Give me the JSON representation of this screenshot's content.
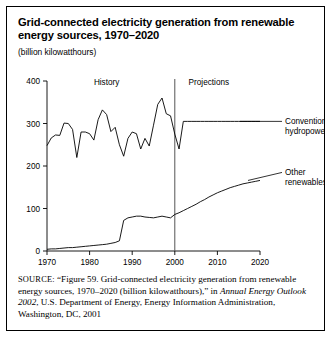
{
  "figure": {
    "title": "Grid-connected electricity generation from renewable energy sources, 1970–2020",
    "units": "(billion kilowatthours)",
    "source_kicker": "SOURCE:",
    "source_part1": " “Figure 59. Grid-connected electricity generation from renewable energy sources, 1970–2020 (billion kilowatthours),” in ",
    "source_italic": "Annual Energy Outlook 2002",
    "source_part2": ", U.S. Department of Energy, Energy Information Administration, Washington, DC, 2001"
  },
  "chart_data": {
    "type": "line",
    "title": "Grid-connected electricity generation from renewable energy sources, 1970–2020",
    "xlabel": "",
    "ylabel": "billion kilowatthours",
    "xlim": [
      1970,
      2020
    ],
    "ylim": [
      0,
      400
    ],
    "xticks": [
      1970,
      1980,
      1990,
      2000,
      2010,
      2020
    ],
    "yticks": [
      0,
      100,
      200,
      300,
      400
    ],
    "grid": false,
    "legend_position": "right-callout",
    "annotations": [
      {
        "text": "History",
        "x": 1984,
        "y": 390
      },
      {
        "text": "Projections",
        "x": 2008,
        "y": 390
      },
      {
        "text": "divider",
        "x": 2000,
        "y": null
      }
    ],
    "divider_year": 2000,
    "x": [
      1970,
      1971,
      1972,
      1973,
      1974,
      1975,
      1976,
      1977,
      1978,
      1979,
      1980,
      1981,
      1982,
      1983,
      1984,
      1985,
      1986,
      1987,
      1988,
      1989,
      1990,
      1991,
      1992,
      1993,
      1994,
      1995,
      1996,
      1997,
      1998,
      1999,
      2000,
      2001,
      2002,
      2003,
      2004,
      2005,
      2006,
      2007,
      2008,
      2009,
      2010,
      2011,
      2012,
      2013,
      2014,
      2015,
      2016,
      2017,
      2018,
      2019,
      2020
    ],
    "series": [
      {
        "name": "Conventional hydropower",
        "label": "Conventional\nhydropower",
        "label_line1": "Conventional",
        "label_line2": "hydropower",
        "values": [
          248,
          266,
          273,
          272,
          301,
          300,
          286,
          220,
          280,
          280,
          276,
          261,
          309,
          332,
          321,
          281,
          291,
          250,
          223,
          265,
          280,
          276,
          240,
          265,
          247,
          296,
          345,
          360,
          323,
          318,
          275,
          240,
          305,
          305,
          305,
          305,
          305,
          305,
          305,
          305,
          305,
          305,
          305,
          305,
          305,
          305,
          305,
          305,
          305,
          305,
          305
        ]
      },
      {
        "name": "Other renewables",
        "label": "Other\nrenewables",
        "label_line1": "Other",
        "label_line2": "renewables",
        "values": [
          4,
          5,
          5,
          6,
          7,
          8,
          8,
          9,
          10,
          11,
          12,
          13,
          14,
          15,
          16,
          18,
          20,
          24,
          72,
          78,
          80,
          82,
          82,
          80,
          79,
          78,
          80,
          82,
          80,
          78,
          86,
          90,
          95,
          100,
          105,
          110,
          116,
          121,
          127,
          132,
          137,
          141,
          145,
          149,
          152,
          155,
          158,
          160,
          162,
          164,
          166
        ]
      }
    ]
  }
}
